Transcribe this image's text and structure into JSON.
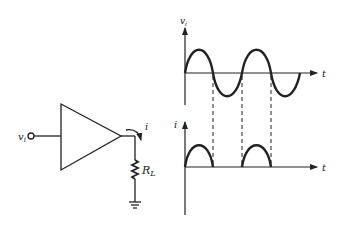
{
  "diagram": {
    "colors": {
      "ink": "#222222",
      "background": "#ffffff"
    },
    "circuit": {
      "input_label": "v",
      "input_subscript": "i",
      "current_label": "i",
      "load_label": "R",
      "load_subscript": "L",
      "components": [
        "input-terminal",
        "amplifier-triangle",
        "load-resistor",
        "ground"
      ]
    },
    "graphs": {
      "top": {
        "ylabel": "v",
        "ylabel_subscript": "i",
        "xlabel": "t",
        "waveform": "sine",
        "cycles": 2
      },
      "bottom": {
        "ylabel": "i",
        "xlabel": "t",
        "waveform": "half-wave rectified (positive half-cycles only)",
        "pulses": 2
      },
      "dashed_guides": 3
    }
  }
}
